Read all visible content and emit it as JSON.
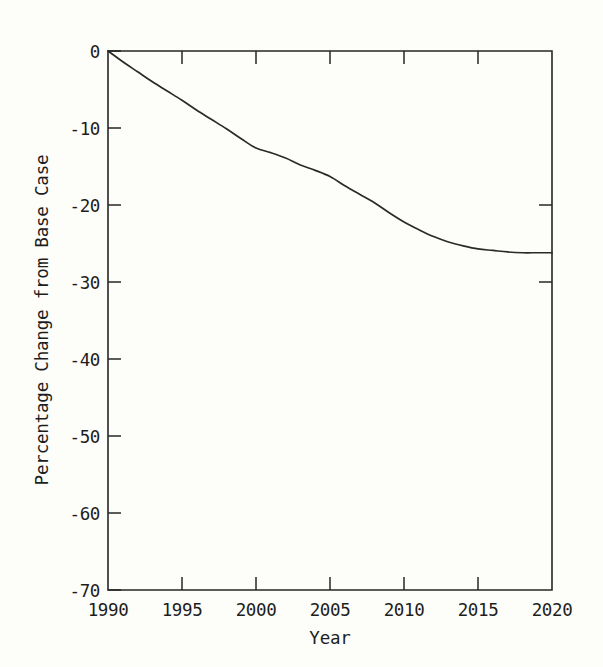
{
  "chart_data": {
    "type": "line",
    "title": "",
    "xlabel": "Year",
    "ylabel": "Percentage Change from Base Case",
    "xlim": [
      1990,
      2020
    ],
    "ylim": [
      -70,
      0
    ],
    "grid": false,
    "legend": false,
    "x_ticks": [
      1990,
      1995,
      2000,
      2005,
      2010,
      2015,
      2020
    ],
    "x_tick_labels": [
      "1990",
      "1995",
      "2000",
      "2005",
      "2010",
      "2015",
      "2020"
    ],
    "y_ticks": [
      0,
      -10,
      -20,
      -30,
      -40,
      -50,
      -60,
      -70
    ],
    "y_tick_labels": [
      "0",
      "-10",
      "-20",
      "-30",
      "-40",
      "-50",
      "-60",
      "-70"
    ],
    "series": [
      {
        "name": "Percentage Change from Base Case",
        "color": "#2a2a2a",
        "x": [
          1990,
          1991,
          1992,
          1993,
          1994,
          1995,
          1996,
          1997,
          1998,
          1999,
          2000,
          2001,
          2002,
          2003,
          2004,
          2005,
          2006,
          2007,
          2008,
          2009,
          2010,
          2011,
          2012,
          2013,
          2014,
          2015,
          2016,
          2017,
          2018,
          2019,
          2020
        ],
        "values": [
          0.0,
          -1.4,
          -2.7,
          -4.0,
          -5.2,
          -6.4,
          -7.7,
          -8.9,
          -10.1,
          -11.4,
          -12.6,
          -13.2,
          -13.9,
          -14.8,
          -15.5,
          -16.3,
          -17.5,
          -18.6,
          -19.7,
          -21.0,
          -22.2,
          -23.2,
          -24.1,
          -24.8,
          -25.3,
          -25.7,
          -25.9,
          -26.1,
          -26.2,
          -26.2,
          -26.2
        ]
      }
    ]
  },
  "axis": {
    "y_title": "Percentage Change from Base Case",
    "x_title": "Year"
  }
}
